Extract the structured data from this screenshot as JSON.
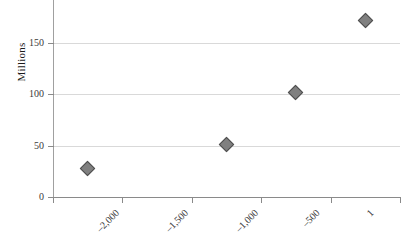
{
  "chart_data": {
    "type": "scatter",
    "title": "",
    "xlabel": "",
    "ylabel": "Millions",
    "categories": [
      "–2,000",
      "–1,500",
      "–1,000",
      "–500",
      "1"
    ],
    "values": [
      28,
      null,
      51,
      101,
      171
    ],
    "series": [
      {
        "name": "Population",
        "points": [
          {
            "x": "–2,000",
            "y": 28
          },
          {
            "x": "–1,000",
            "y": 51
          },
          {
            "x": "–500",
            "y": 101
          },
          {
            "x": "1",
            "y": 171
          }
        ]
      }
    ],
    "ylim": [
      0,
      200
    ],
    "yticks": [
      "0",
      "50",
      "100",
      "150",
      "200"
    ],
    "ytick_values": [
      0,
      50,
      100,
      150,
      200
    ],
    "grid": true,
    "legend": "none",
    "marker_shape": "diamond",
    "marker_color": "#808080",
    "marker_edge_color": "#4d4d4d",
    "gridline_color": "#d9d9d9",
    "axis_color": "#8a8a8a"
  },
  "axes": {
    "y_title": "Millions"
  }
}
